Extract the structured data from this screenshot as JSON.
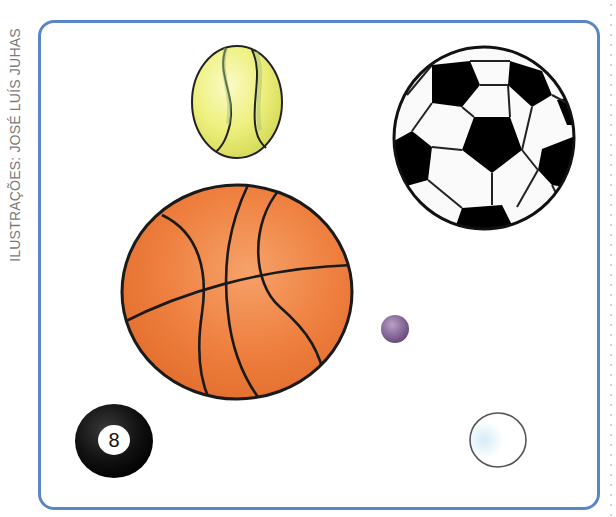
{
  "credit": {
    "text": "ILUSTRAÇÕES: JOSÉ LUÍS JUHAS"
  },
  "frame": {
    "border_color": "#5a86c6"
  },
  "balls": [
    {
      "name": "tennis-ball",
      "color": "#eef08a"
    },
    {
      "name": "soccer-ball",
      "color": "#000000"
    },
    {
      "name": "basketball",
      "color": "#ee7f3e"
    },
    {
      "name": "marble",
      "color": "#8c6a9a"
    },
    {
      "name": "eight-ball",
      "color": "#111111",
      "number": "8"
    },
    {
      "name": "ping-pong-ball",
      "color": "#ffffff"
    }
  ]
}
